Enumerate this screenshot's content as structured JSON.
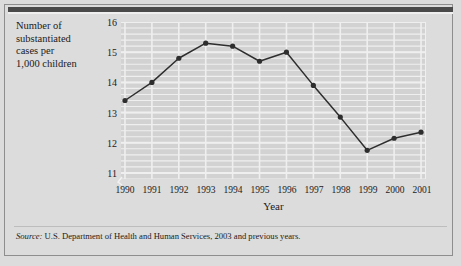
{
  "figure": {
    "y_axis_title": "Number of substantiated cases per 1,000 children",
    "y_axis_title_lines": [
      "Number of",
      "substantiated",
      "cases per",
      "1,000 children"
    ],
    "source_prefix": "Source:",
    "source_text": "U.S. Department of Health and Human Services, 2003 and previous years.",
    "colors": {
      "page_background": "#dcdcdc",
      "plot_background": "#d2d2d2",
      "gridline": "#efefef",
      "series_line": "#2e2e2e",
      "marker": "#2e2e2e",
      "frame": "#8e8e8e",
      "top_rule": "#4a4a4a",
      "text": "#1b1b1b"
    }
  },
  "chart_data": {
    "type": "line",
    "title": "",
    "xlabel": "Year",
    "ylabel": "Number of substantiated cases per 1,000 children",
    "categories": [
      "1990",
      "1991",
      "1992",
      "1993",
      "1994",
      "1995",
      "1996",
      "1997",
      "1998",
      "1999",
      "2000",
      "2001"
    ],
    "x": [
      1990,
      1991,
      1992,
      1993,
      1994,
      1995,
      1996,
      1997,
      1998,
      1999,
      2000,
      2001
    ],
    "values": [
      13.4,
      14.0,
      14.8,
      15.3,
      15.2,
      14.7,
      15.0,
      13.9,
      12.85,
      11.75,
      12.15,
      12.35
    ],
    "series": [
      {
        "name": "Substantiated cases per 1,000 children",
        "values": [
          13.4,
          14.0,
          14.8,
          15.3,
          15.2,
          14.7,
          15.0,
          13.9,
          12.85,
          11.75,
          12.15,
          12.35
        ]
      }
    ],
    "ylim": [
      10.8,
      16.0
    ],
    "ytick_values": [
      11,
      12,
      13,
      14,
      15,
      16
    ],
    "ytick_labels": [
      "11",
      "12",
      "13",
      "14",
      "15",
      "16"
    ],
    "y_minor_step": 0.2,
    "grid": true,
    "grid_minor": true,
    "legend": "none",
    "markers": "filled-circle"
  }
}
